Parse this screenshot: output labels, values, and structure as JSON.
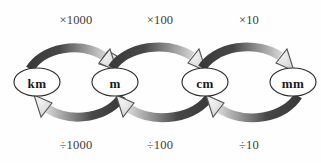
{
  "diagram": {
    "background_color": "#fefefe",
    "nodes": [
      {
        "id": "km",
        "label": "km",
        "cx": 37,
        "cy": 82,
        "rx": 23,
        "ry": 14
      },
      {
        "id": "m",
        "label": "m",
        "cx": 115,
        "cy": 82,
        "rx": 23,
        "ry": 14
      },
      {
        "id": "cm",
        "label": "cm",
        "cx": 205,
        "cy": 82,
        "rx": 23,
        "ry": 14
      },
      {
        "id": "mm",
        "label": "mm",
        "cx": 293,
        "cy": 82,
        "rx": 23,
        "ry": 14
      }
    ],
    "conversions": [
      {
        "from": "km",
        "to": "m",
        "multiply_label": "×1000",
        "divide_label": "÷1000",
        "multiply_label_x": 76,
        "multiply_label_y": 20,
        "divide_label_x": 76,
        "divide_label_y": 145
      },
      {
        "from": "m",
        "to": "cm",
        "multiply_label": "×100",
        "divide_label": "÷100",
        "multiply_label_x": 160,
        "multiply_label_y": 20,
        "divide_label_x": 160,
        "divide_label_y": 145
      },
      {
        "from": "cm",
        "to": "mm",
        "multiply_label": "×10",
        "divide_label": "÷10",
        "multiply_label_x": 249,
        "multiply_label_y": 20,
        "divide_label_x": 249,
        "divide_label_y": 145
      }
    ],
    "colors": {
      "arrow_dark": "#3a3a3a",
      "arrow_light": "#d8d8d8",
      "arrow_head_fill": "#e2e2e2",
      "arrow_head_stroke": "#555555",
      "node_stroke": "#2e2e2e",
      "node_fill": "#ffffff",
      "text_dark": "#1a1a1a",
      "label_text": "#3b3b3b"
    }
  }
}
